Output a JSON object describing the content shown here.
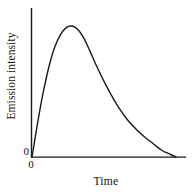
{
  "figure": {
    "background_color": "#ffffff",
    "ink_color": "#1a1a1a"
  },
  "chart_data": {
    "type": "line",
    "title": "",
    "subtitle": "",
    "xlabel": "Time",
    "ylabel": "Emission intensity",
    "x_tick_labels": [
      "0"
    ],
    "y_tick_labels": [
      "0"
    ],
    "origin_label_x": "0",
    "origin_label_y": "0",
    "grid": false,
    "legend": null,
    "legend_position": "none",
    "axis_color": "#1a1a1a",
    "line_color": "#1a1a1a",
    "line_width": 1.4,
    "xlim": [
      0,
      1
    ],
    "ylim": [
      0,
      1
    ],
    "axes_shown": [
      "left",
      "bottom"
    ],
    "annotations": [],
    "series": [
      {
        "name": "Emission intensity",
        "x": [
          0.0,
          0.02,
          0.05,
          0.08,
          0.12,
          0.16,
          0.2,
          0.24,
          0.27,
          0.3,
          0.33,
          0.36,
          0.4,
          0.45,
          0.5,
          0.55,
          0.6,
          0.66,
          0.72,
          0.78,
          0.84,
          0.9,
          0.94,
          1.0
        ],
        "y": [
          0.0,
          0.13,
          0.32,
          0.49,
          0.68,
          0.82,
          0.91,
          0.96,
          0.97,
          0.96,
          0.93,
          0.88,
          0.79,
          0.67,
          0.56,
          0.46,
          0.37,
          0.28,
          0.21,
          0.15,
          0.1,
          0.05,
          0.03,
          0.0
        ]
      }
    ],
    "peak": {
      "x": 0.27,
      "y": 0.97
    }
  },
  "labels": {
    "y_axis_title": "Emission intensity",
    "x_axis_title": "Time",
    "zero_on_y_axis": "0",
    "zero_on_x_axis": "0"
  }
}
